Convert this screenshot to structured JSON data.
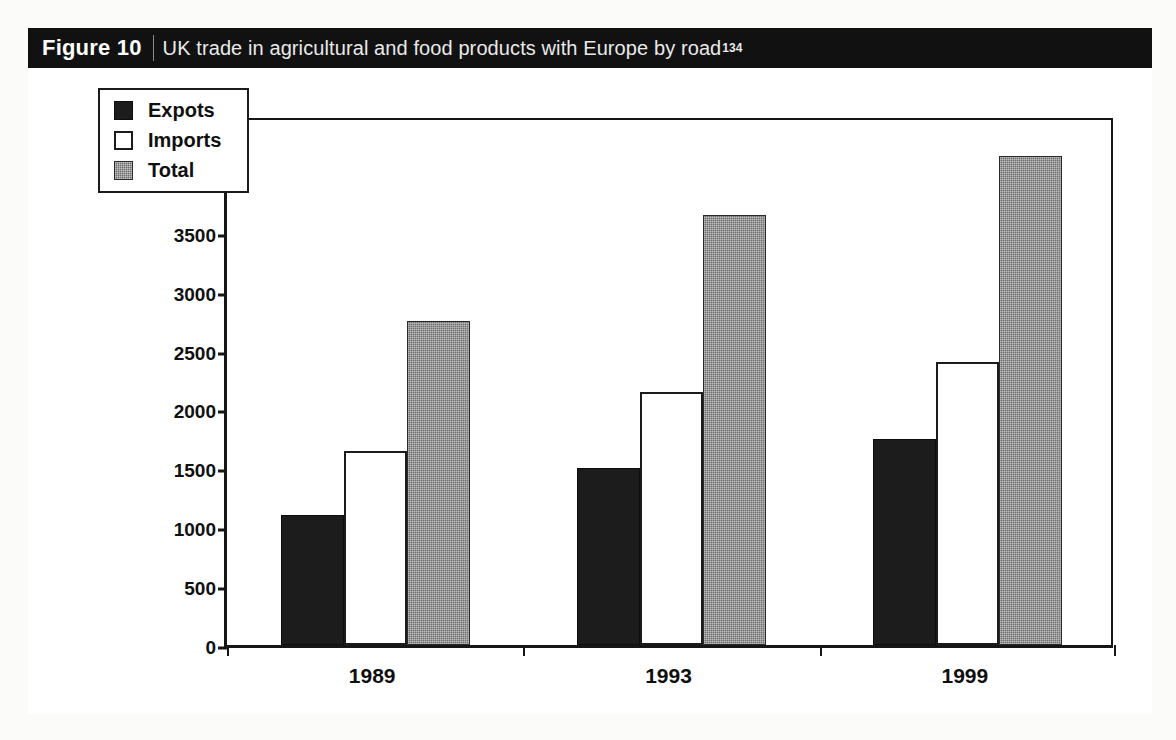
{
  "figure": {
    "number_label": "Figure 10",
    "caption": "UK trade in agricultural and food products with Europe by road",
    "reference_superscript": "134"
  },
  "colors": {
    "exports": "#1c1c1c",
    "imports": "#ffffff",
    "total": "#6f6f6f",
    "axis": "#161616",
    "caption_band": "#111111"
  },
  "chart_data": {
    "type": "bar",
    "title": "UK trade in agricultural and food products with Europe by road",
    "xlabel": "",
    "ylabel": "Tonne-kilometres (Million)",
    "categories": [
      "1989",
      "1993",
      "1999"
    ],
    "series": [
      {
        "name": "Expots",
        "values": [
          1100,
          1500,
          1750
        ]
      },
      {
        "name": "Imports",
        "values": [
          1650,
          2150,
          2400
        ]
      },
      {
        "name": "Total",
        "values": [
          2750,
          3650,
          4150
        ]
      }
    ],
    "ylim": [
      0,
      4500
    ],
    "ytick_step": 500,
    "yticks": [
      4500,
      4000,
      3500,
      3000,
      2500,
      2000,
      1500,
      1000,
      500,
      0
    ],
    "ytick_labels": [
      "4500",
      "4000",
      "3500",
      "3000",
      "2500",
      "2000",
      "1500",
      "1000",
      "500",
      "0"
    ],
    "grid": false,
    "legend_position": "top-left",
    "legend_entries": [
      "Expots",
      "Imports",
      "Total"
    ]
  }
}
